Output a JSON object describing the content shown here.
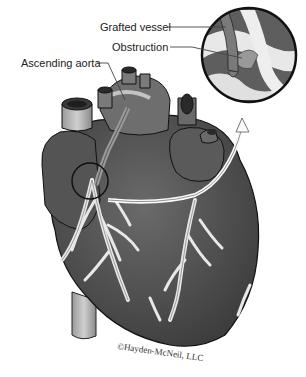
{
  "figure": {
    "labels": [
      {
        "id": "grafted-vessel",
        "text": "Grafted vessel"
      },
      {
        "id": "obstruction",
        "text": "Obstruction"
      },
      {
        "id": "ascending-aorta",
        "text": "Ascending aorta"
      }
    ],
    "credit": "©Hayden-McNeil, LLC",
    "colors": {
      "heart_dark": "#4a4a4a",
      "heart_mid": "#6b6b6b",
      "vessel_light": "#e6e6e6",
      "outline": "#111111",
      "background": "#ffffff"
    }
  }
}
